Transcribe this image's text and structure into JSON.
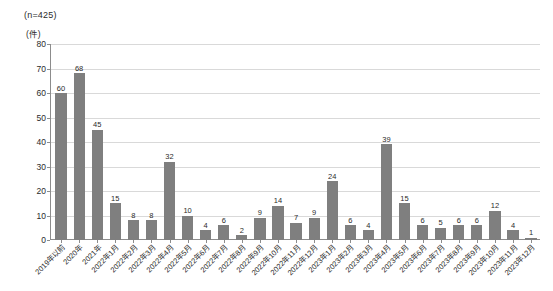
{
  "header": {
    "sample_size": "(n=425)",
    "unit": "(件)"
  },
  "chart_data": {
    "type": "bar",
    "title": "",
    "subtitle": "(n=425)",
    "xlabel": "",
    "ylabel": "(件)",
    "ylim": [
      0,
      80
    ],
    "yticks": [
      0,
      10,
      20,
      30,
      40,
      50,
      60,
      70,
      80
    ],
    "grid": true,
    "legend": "none",
    "bar_color": "#7f7f7f",
    "grid_color": "#d9d9d9",
    "axis_color": "#8c8c8c",
    "categories": [
      "2019年以前",
      "2020年",
      "2021年",
      "2022年1月",
      "2022年2月",
      "2022年3月",
      "2022年4月",
      "2022年5月",
      "2022年6月",
      "2022年7月",
      "2022年8月",
      "2022年9月",
      "2022年10月",
      "2022年11月",
      "2022年12月",
      "2023年1月",
      "2023年2月",
      "2023年3月",
      "2023年4月",
      "2023年5月",
      "2023年6月",
      "2023年7月",
      "2023年8月",
      "2023年9月",
      "2023年10月",
      "2023年11月",
      "2023年12月"
    ],
    "values": [
      60,
      68,
      45,
      15,
      8,
      8,
      32,
      10,
      4,
      6,
      2,
      9,
      14,
      7,
      9,
      24,
      6,
      4,
      39,
      15,
      6,
      5,
      6,
      6,
      12,
      4,
      1
    ]
  }
}
